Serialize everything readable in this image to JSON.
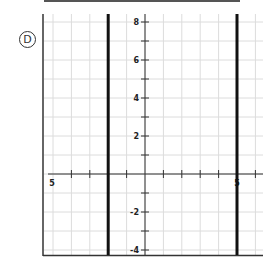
{
  "option": {
    "label": "D"
  },
  "graph": {
    "x_range": [
      -5.5,
      6.5
    ],
    "y_range": [
      -4.5,
      8.5
    ],
    "y_tick_labels": [
      "8",
      "6",
      "4",
      "2",
      "-2",
      "-4"
    ],
    "x_tick_labels": [
      "5",
      "5"
    ],
    "vertical_lines": [
      {
        "x": -2,
        "label": "x = -2"
      },
      {
        "x": 5,
        "label": "x = 5"
      }
    ],
    "line_color": "#111111",
    "grid_color": "#d9d9d9",
    "axis_color": "#333333"
  }
}
